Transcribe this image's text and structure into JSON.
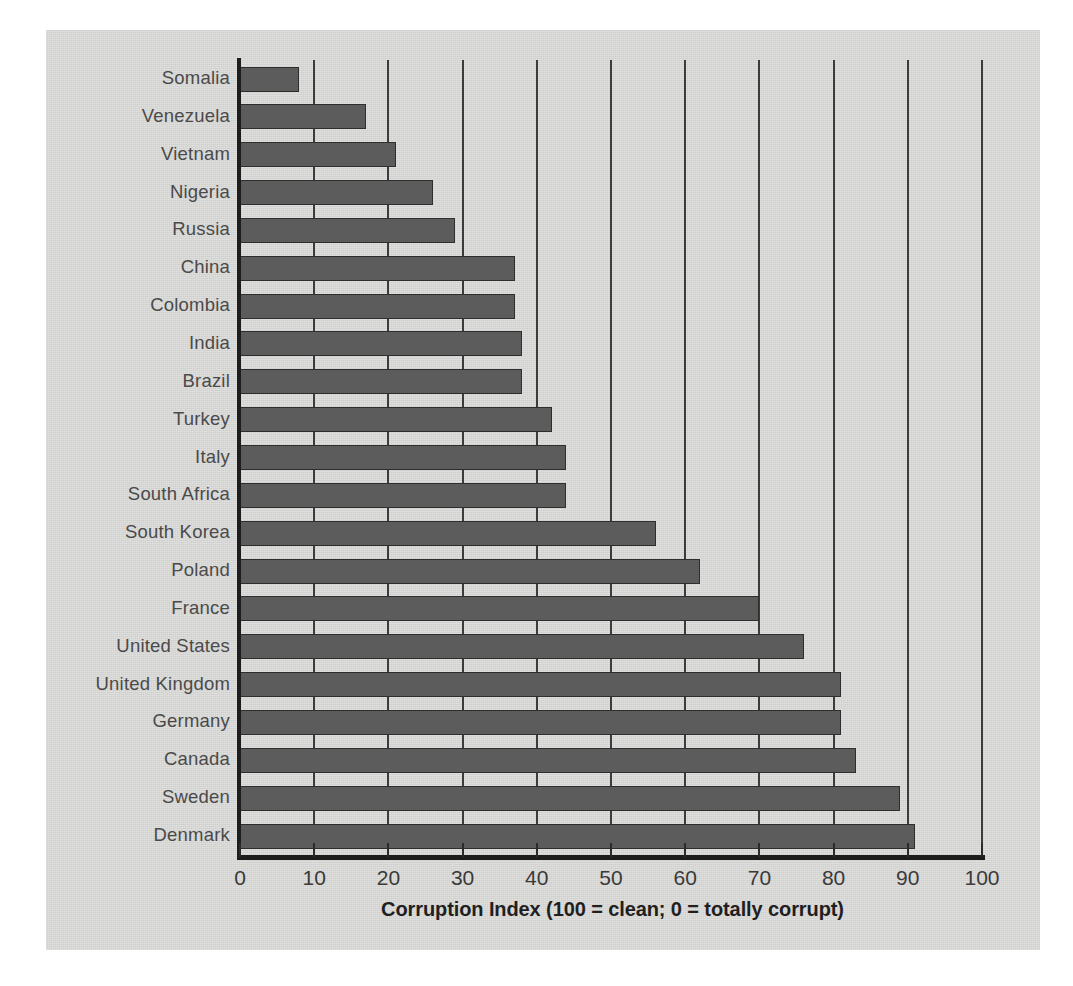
{
  "chart_data": {
    "type": "bar",
    "orientation": "horizontal",
    "title": "",
    "xlabel": "Corruption Index (100 = clean; 0 = totally corrupt)",
    "ylabel": "",
    "xlim": [
      0,
      100
    ],
    "xticks": [
      0,
      10,
      20,
      30,
      40,
      50,
      60,
      70,
      80,
      90,
      100
    ],
    "grid": "vertical",
    "legend": "none",
    "bar_color": "#5c5c5c",
    "background_color": "#d6d6d4",
    "categories": [
      "Somalia",
      "Venezuela",
      "Vietnam",
      "Nigeria",
      "Russia",
      "China",
      "Colombia",
      "India",
      "Brazil",
      "Turkey",
      "Italy",
      "South Africa",
      "South Korea",
      "Poland",
      "France",
      "United States",
      "United Kingdom",
      "Germany",
      "Canada",
      "Sweden",
      "Denmark"
    ],
    "values": [
      8,
      17,
      21,
      26,
      29,
      37,
      37,
      38,
      38,
      42,
      44,
      44,
      56,
      62,
      70,
      76,
      81,
      81,
      83,
      89,
      91
    ]
  }
}
